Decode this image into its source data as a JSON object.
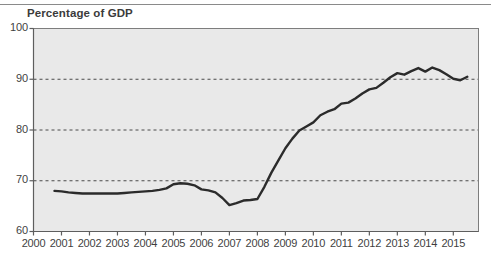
{
  "figure": {
    "title": "Percentage of GDP",
    "top_rule_color": "#8a8a8a",
    "background": "#ffffff",
    "plot_background": "#e9e9e9",
    "line_color": "#2b2b2b",
    "gridline_color": "#4a4a4a",
    "axis_color": "#7d7d7d",
    "text_color": "#3f3f3f"
  },
  "chart_data": {
    "type": "line",
    "title": "Percentage of GDP",
    "xlabel": "",
    "ylabel": "Percentage of GDP",
    "xlim": [
      2000,
      2015.9
    ],
    "ylim": [
      60,
      100
    ],
    "yticks": [
      60,
      70,
      80,
      90,
      100
    ],
    "ytick_labels": [
      "60",
      "70",
      "80",
      "90",
      "100"
    ],
    "gridlines_y": [
      70,
      80,
      90
    ],
    "grid": "dashed-horizontal",
    "legend": "none",
    "xticks": [
      2000,
      2001,
      2002,
      2003,
      2004,
      2005,
      2006,
      2007,
      2008,
      2009,
      2010,
      2011,
      2012,
      2013,
      2014,
      2015
    ],
    "xtick_labels": [
      "2000",
      "2001",
      "2002",
      "2003",
      "2004",
      "2005",
      "2006",
      "2007",
      "2008",
      "2009",
      "2010",
      "2011",
      "2012",
      "2013",
      "2014",
      "2015"
    ],
    "series": [
      {
        "name": "Percentage of GDP",
        "color": "#2b2b2b",
        "x": [
          2000.75,
          2001.0,
          2001.25,
          2001.5,
          2001.75,
          2002.0,
          2002.25,
          2002.5,
          2002.75,
          2003.0,
          2003.25,
          2003.5,
          2003.75,
          2004.0,
          2004.25,
          2004.5,
          2004.75,
          2005.0,
          2005.25,
          2005.5,
          2005.75,
          2006.0,
          2006.25,
          2006.5,
          2006.75,
          2007.0,
          2007.25,
          2007.5,
          2007.75,
          2008.0,
          2008.25,
          2008.5,
          2008.75,
          2009.0,
          2009.25,
          2009.5,
          2009.75,
          2010.0,
          2010.25,
          2010.5,
          2010.75,
          2011.0,
          2011.25,
          2011.5,
          2011.75,
          2012.0,
          2012.25,
          2012.5,
          2012.75,
          2013.0,
          2013.25,
          2013.5,
          2013.75,
          2014.0,
          2014.25,
          2014.5,
          2014.75,
          2015.0,
          2015.25,
          2015.5
        ],
        "y": [
          68.0,
          67.9,
          67.7,
          67.6,
          67.5,
          67.5,
          67.5,
          67.5,
          67.5,
          67.5,
          67.6,
          67.7,
          67.8,
          67.9,
          68.0,
          68.2,
          68.5,
          69.3,
          69.5,
          69.4,
          69.1,
          68.3,
          68.1,
          67.7,
          66.6,
          65.2,
          65.6,
          66.1,
          66.2,
          66.4,
          68.8,
          71.6,
          74.0,
          76.4,
          78.3,
          79.9,
          80.7,
          81.5,
          82.9,
          83.6,
          84.1,
          85.2,
          85.4,
          86.2,
          87.2,
          88.0,
          88.3,
          89.3,
          90.4,
          91.2,
          90.9,
          91.6,
          92.2,
          91.5,
          92.3,
          91.8,
          91.0,
          90.1,
          89.8,
          90.5
        ]
      }
    ]
  }
}
